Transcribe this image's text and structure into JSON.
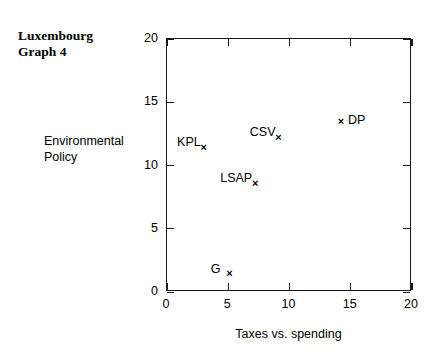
{
  "title": {
    "line1": "Luxembourg",
    "line2": "Graph 4"
  },
  "axes": {
    "y_title_line1": "Environmental",
    "y_title_line2": "Policy",
    "x_title": "Taxes vs. spending"
  },
  "chart_data": {
    "type": "scatter",
    "title": "Luxembourg Graph 4",
    "xlabel": "Taxes vs. spending",
    "ylabel": "Environmental Policy",
    "xlim": [
      0,
      20
    ],
    "ylim": [
      0,
      20
    ],
    "xticks": [
      "0",
      "5",
      "10",
      "15",
      "20"
    ],
    "yticks": [
      "0",
      "5",
      "10",
      "15",
      "20"
    ],
    "grid": false,
    "legend": "none",
    "marker": "x",
    "points": [
      {
        "name": "KPL",
        "x": 3.0,
        "y": 11.2,
        "label_position": "left"
      },
      {
        "name": "CSV",
        "x": 9.1,
        "y": 12.0,
        "label_position": "left"
      },
      {
        "name": "DP",
        "x": 14.2,
        "y": 13.3,
        "label_position": "right"
      },
      {
        "name": "LSAP",
        "x": 7.2,
        "y": 8.4,
        "label_position": "left"
      },
      {
        "name": "G",
        "x": 5.1,
        "y": 1.3,
        "label_position": "left-gap"
      }
    ]
  },
  "marker_glyph": "×"
}
